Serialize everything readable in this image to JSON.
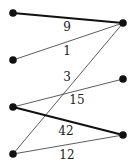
{
  "graph": {
    "type": "bipartite",
    "left_nodes": [
      {
        "id": "L1",
        "x": 13,
        "y": 13
      },
      {
        "id": "L2",
        "x": 13,
        "y": 60
      },
      {
        "id": "L3",
        "x": 13,
        "y": 107
      },
      {
        "id": "L4",
        "x": 13,
        "y": 154
      }
    ],
    "right_nodes": [
      {
        "id": "R1",
        "x": 123,
        "y": 23
      },
      {
        "id": "R2",
        "x": 123,
        "y": 79
      },
      {
        "id": "R3",
        "x": 123,
        "y": 135
      }
    ],
    "edges": [
      {
        "from": "L1",
        "to": "R1",
        "weight": "9",
        "bold": true,
        "label_x": 67,
        "label_y": 31
      },
      {
        "from": "L2",
        "to": "R1",
        "weight": "1",
        "bold": false,
        "label_x": 67,
        "label_y": 55
      },
      {
        "from": "L4",
        "to": "R1",
        "weight": "3",
        "bold": false,
        "label_x": 67,
        "label_y": 81
      },
      {
        "from": "L3",
        "to": "R2",
        "weight": "15",
        "bold": false,
        "label_x": 77,
        "label_y": 104
      },
      {
        "from": "L3",
        "to": "R3",
        "weight": "42",
        "bold": true,
        "label_x": 66,
        "label_y": 135
      },
      {
        "from": "L4",
        "to": "R3",
        "weight": "12",
        "bold": false,
        "label_x": 67,
        "label_y": 159
      }
    ],
    "colors": {
      "node": "#111111",
      "edge": "#333333",
      "bold_edge": "#111111"
    }
  }
}
